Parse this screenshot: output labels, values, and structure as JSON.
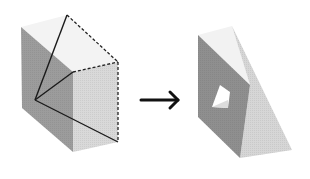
{
  "diagram": {
    "description": "A cube is sliced by a plane through three vertices; the resulting solid is shown with a triangular hole",
    "left_figure": {
      "label": "cube with cutting plane",
      "colors": {
        "left_face": "#9a9a9a",
        "front_face": "#d8d8d8",
        "top_face": "#f3f3f3",
        "edge": "#1a1a1a"
      },
      "solid_edges": "three cut lines from a front-left vertex",
      "dashed_edges": "top-right portion of cube outline"
    },
    "arrow": {
      "glyph": "→",
      "direction": "right"
    },
    "right_figure": {
      "label": "resulting wedge solid with hole",
      "colors": {
        "dark_face": "#8f8f8f",
        "light_face": "#d4d4d4",
        "top_face": "#f2f2f2",
        "hole": "#ffffff"
      }
    }
  }
}
